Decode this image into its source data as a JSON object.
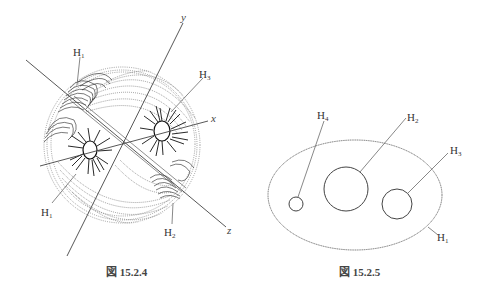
{
  "figures": [
    {
      "id": "left",
      "caption": "図 15.2.4",
      "axes": {
        "x": "x",
        "y": "y",
        "z": "z"
      },
      "labels": [
        {
          "name": "H",
          "sub": "1",
          "pos": "top-left"
        },
        {
          "name": "H",
          "sub": "3",
          "pos": "top-right"
        },
        {
          "name": "H",
          "sub": "1",
          "pos": "bottom-left"
        },
        {
          "name": "H",
          "sub": "2",
          "pos": "bottom-right"
        }
      ]
    },
    {
      "id": "right",
      "caption": "図 15.2.5",
      "labels": [
        {
          "name": "H",
          "sub": "4"
        },
        {
          "name": "H",
          "sub": "2"
        },
        {
          "name": "H",
          "sub": "3"
        },
        {
          "name": "H",
          "sub": "1"
        }
      ]
    }
  ],
  "colors": {
    "line": "#555555",
    "dots": "#888888",
    "text": "#333333"
  }
}
